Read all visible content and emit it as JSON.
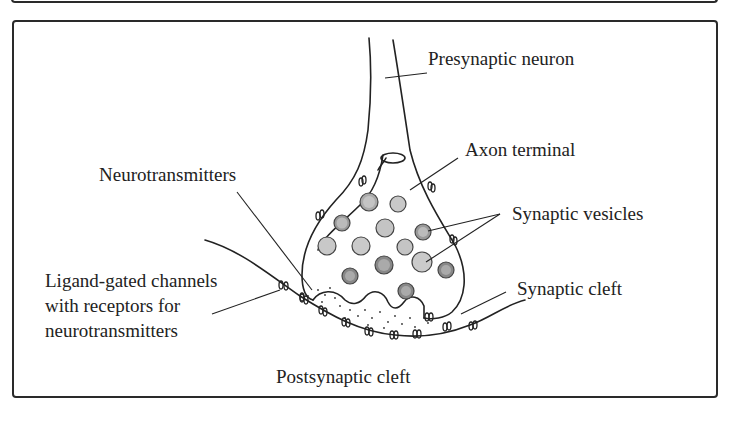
{
  "diagram": {
    "type": "synapse-anatomy",
    "labels": {
      "presynaptic_neuron": "Presynaptic neuron",
      "axon_terminal": "Axon terminal",
      "neurotransmitters": "Neurotransmitters",
      "synaptic_vesicles": "Synaptic vesicles",
      "ligand_gated_line1": "Ligand-gated channels",
      "ligand_gated_line2": "with receptors for",
      "ligand_gated_line3": "neurotransmitters",
      "synaptic_cleft": "Synaptic cleft",
      "postsynaptic": "Postsynaptic cleft"
    },
    "colors": {
      "stroke": "#222222",
      "vesicle_fill": "#bdbdbd",
      "vesicle_dark": "#8a8a8a",
      "border": "#2a2a2a"
    }
  }
}
